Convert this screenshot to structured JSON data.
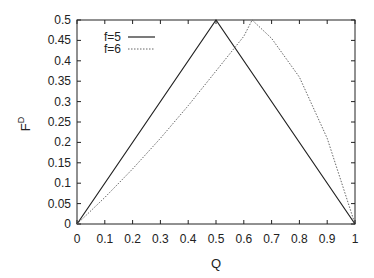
{
  "chart_data": {
    "type": "line",
    "title": "",
    "xlabel": "Q",
    "ylabel": "F^D",
    "ylabel_main": "F",
    "ylabel_sup": "D",
    "xlim": [
      0,
      1
    ],
    "ylim": [
      0,
      0.5
    ],
    "grid": false,
    "legend_position": "upper-left",
    "x_ticks": [
      "0",
      "0.1",
      "0.2",
      "0.3",
      "0.4",
      "0.5",
      "0.6",
      "0.7",
      "0.8",
      "0.9",
      "1"
    ],
    "y_ticks": [
      "0",
      "0.05",
      "0.1",
      "0.15",
      "0.2",
      "0.25",
      "0.3",
      "0.35",
      "0.4",
      "0.45",
      "0.5"
    ],
    "series": [
      {
        "name": "f=5",
        "style": "solid",
        "x": [
          0,
          0.5,
          1
        ],
        "y": [
          0,
          0.5,
          0
        ]
      },
      {
        "name": "f=6",
        "style": "dotted",
        "x": [
          0,
          0.1,
          0.2,
          0.3,
          0.4,
          0.5,
          0.6,
          0.63,
          0.7,
          0.8,
          0.9,
          1.0
        ],
        "y": [
          0,
          0.065,
          0.135,
          0.21,
          0.29,
          0.375,
          0.46,
          0.5,
          0.455,
          0.36,
          0.21,
          0
        ]
      }
    ]
  }
}
